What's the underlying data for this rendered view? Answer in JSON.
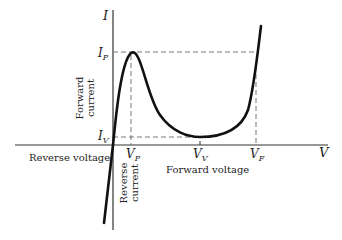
{
  "diagram": {
    "axes": {
      "y_label": "I",
      "x_label": "V"
    },
    "markers": {
      "ip": "I",
      "ip_sub": "P",
      "iv": "I",
      "iv_sub": "V",
      "vp": "V",
      "vp_sub": "P",
      "vv": "V",
      "vv_sub": "V",
      "vf": "V",
      "vf_sub": "F"
    },
    "region_labels": {
      "forward_current_line1": "Forward",
      "forward_current_line2": "current",
      "reverse_current_line1": "Reverse",
      "reverse_current_line2": "current",
      "reverse_voltage": "Reverse voltage",
      "forward_voltage": "Forward voltage"
    },
    "colors": {
      "curve": "#111111",
      "axes": "#333333",
      "dashed": "#777777"
    }
  }
}
